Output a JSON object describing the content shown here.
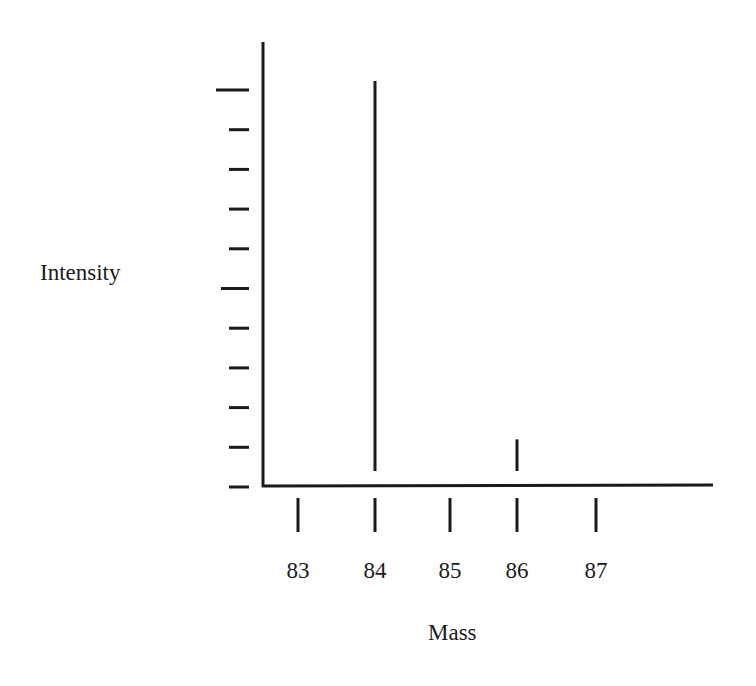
{
  "chart_data": {
    "type": "bar",
    "title": "",
    "xlabel": "Mass",
    "ylabel": "Intensity",
    "categories": [
      "83",
      "84",
      "85",
      "86",
      "87"
    ],
    "values": [
      0,
      100,
      0,
      12,
      0
    ],
    "x_ticks": [
      "83",
      "84",
      "85",
      "86",
      "87"
    ],
    "y_ticks_count": 11,
    "y_tick_labels": [],
    "ylim": [
      0,
      100
    ],
    "grid": false,
    "legend": null,
    "style": "stick spectrum (mass spectrum)"
  },
  "labels": {
    "y_axis": "Intensity",
    "x_axis": "Mass"
  }
}
